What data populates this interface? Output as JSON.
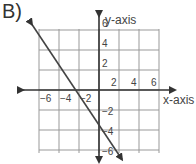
{
  "problem_label": "B)",
  "chart_data": {
    "type": "line",
    "title": "",
    "xlabel": "x-axis",
    "ylabel": "y-axis",
    "xlim": [
      -6,
      6
    ],
    "ylim": [
      -6,
      6
    ],
    "grid": true,
    "grid_step": 2,
    "x_ticks": [
      -6,
      -4,
      -2,
      2,
      4,
      6
    ],
    "y_ticks": [
      6,
      4,
      2,
      -2,
      -4,
      -6
    ],
    "series": [
      {
        "name": "line",
        "equation": "y = -1.5x - 3.5",
        "x": [
          -6.7,
          2.3
        ],
        "y": [
          6.55,
          -6.95
        ],
        "arrows": "both",
        "color": "#444444"
      }
    ]
  }
}
